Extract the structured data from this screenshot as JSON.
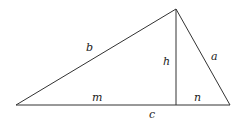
{
  "diagram": {
    "type": "right-triangle-altitude",
    "labels": {
      "side_b": "b",
      "side_a": "a",
      "altitude": "h",
      "segment_m": "m",
      "segment_n": "n",
      "base_c": "c"
    },
    "colors": {
      "stroke": "#333333",
      "background": "#ffffff"
    }
  }
}
